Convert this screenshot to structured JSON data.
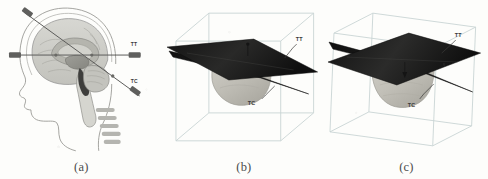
{
  "figure": {
    "background_color": "#fdfdfb",
    "panels": [
      {
        "id": "panel-a",
        "caption": "(a)",
        "description": "Sagittal schematic of a human head and brain with two stereotactic electrode trajectories",
        "labels": [
          {
            "text": "TT",
            "meaning": "transthalamic trajectory"
          },
          {
            "text": "TC",
            "meaning": "transcerebellar trajectory"
          }
        ]
      },
      {
        "id": "panel-b",
        "caption": "(b)",
        "description": "Three-dimensional wireframe bounding box containing a rendered deep brain structure intersected by two planar trajectories",
        "labels": [
          {
            "text": "TT",
            "meaning": "transthalamic trajectory plane"
          },
          {
            "text": "TC",
            "meaning": "transcerebellar trajectory plane"
          }
        ]
      },
      {
        "id": "panel-c",
        "caption": "(c)",
        "description": "Same three-dimensional scene as panel b viewed from a rotated camera angle",
        "labels": [
          {
            "text": "TT",
            "meaning": "transthalamic trajectory plane"
          },
          {
            "text": "TC",
            "meaning": "transcerebellar trajectory plane"
          }
        ]
      }
    ],
    "colors": {
      "plane": "#1b1b1b",
      "wireframe": "#c9d6d6",
      "structure_fill": "#b9b6ae",
      "brain_outline": "#8f8f8f",
      "label_text": "#3a3a3a",
      "caption_text": "#4b4b4b",
      "electrode": "#6e6e6e"
    }
  }
}
